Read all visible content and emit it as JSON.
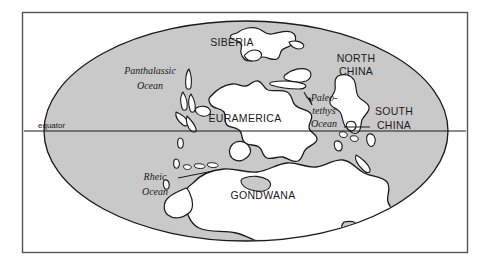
{
  "figure": {
    "frame": {
      "x": 22,
      "y": 12,
      "width": 446,
      "height": 241
    }
  },
  "colors": {
    "ocean": "#c9c9c9",
    "land": "#ffffff",
    "outline": "#1a1a1a",
    "frame": "#555555",
    "background": "#ffffff",
    "text": "#1a1a1a"
  },
  "projection": {
    "type": "ellipse",
    "center_x": 246,
    "center_y": 131,
    "radius_x": 202,
    "radius_y": 110
  },
  "equator": {
    "label": "equator",
    "label_x": 38,
    "label_y": 128,
    "line_y": 131,
    "line_x1": 24,
    "line_x2": 466
  },
  "continents": [
    {
      "name": "siberia",
      "label": "SIBERIA",
      "x": 232,
      "y": 46,
      "anchor": "middle"
    },
    {
      "name": "euramerica",
      "label": "EURAMERICA",
      "x": 245,
      "y": 122,
      "anchor": "middle"
    },
    {
      "name": "north-china",
      "label": "NORTH",
      "label2": "CHINA",
      "x": 356,
      "y": 66,
      "anchor": "middle"
    },
    {
      "name": "south-china",
      "label": "SOUTH",
      "label2": "CHINA",
      "x": 392,
      "y": 115,
      "anchor": "middle"
    },
    {
      "name": "gondwana",
      "label": "GONDWANA",
      "x": 263,
      "y": 198,
      "anchor": "middle"
    }
  ],
  "oceans": [
    {
      "name": "panthalassic-ocean",
      "label": "Panthalassic",
      "label2": "Ocean",
      "x": 150,
      "y": 74,
      "anchor": "middle"
    },
    {
      "name": "paleo-tethys-ocean",
      "label": "Paleo-",
      "label2": "tethys",
      "label3": "Ocean",
      "x": 322,
      "y": 100,
      "anchor": "middle"
    },
    {
      "name": "rheic-ocean",
      "label": "Rheic",
      "label2": "Ocean",
      "x": 155,
      "y": 180,
      "anchor": "middle"
    }
  ],
  "leaders": [
    {
      "name": "rheic-leader-line",
      "x1": 178,
      "y1": 178,
      "x2": 213,
      "y2": 171
    },
    {
      "name": "south-china-leader-line",
      "x1": 344,
      "y1": 127,
      "x2": 370,
      "y2": 127
    },
    {
      "name": "paleotethys-leader-arrow",
      "x1": 312,
      "y1": 104,
      "x2": 303,
      "y2": 92
    }
  ]
}
